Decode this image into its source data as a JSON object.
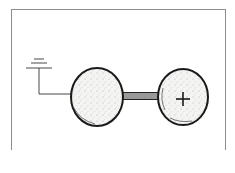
{
  "figure": {
    "left_sphere": {
      "label": ""
    },
    "right_sphere": {
      "label": "+"
    },
    "ground_symbol": "ground-icon",
    "colors": {
      "stroke": "#1a1a1a",
      "frame": "#8c8c8c",
      "fill": "#f4f4f2"
    }
  },
  "caption": {
    "text": ""
  }
}
